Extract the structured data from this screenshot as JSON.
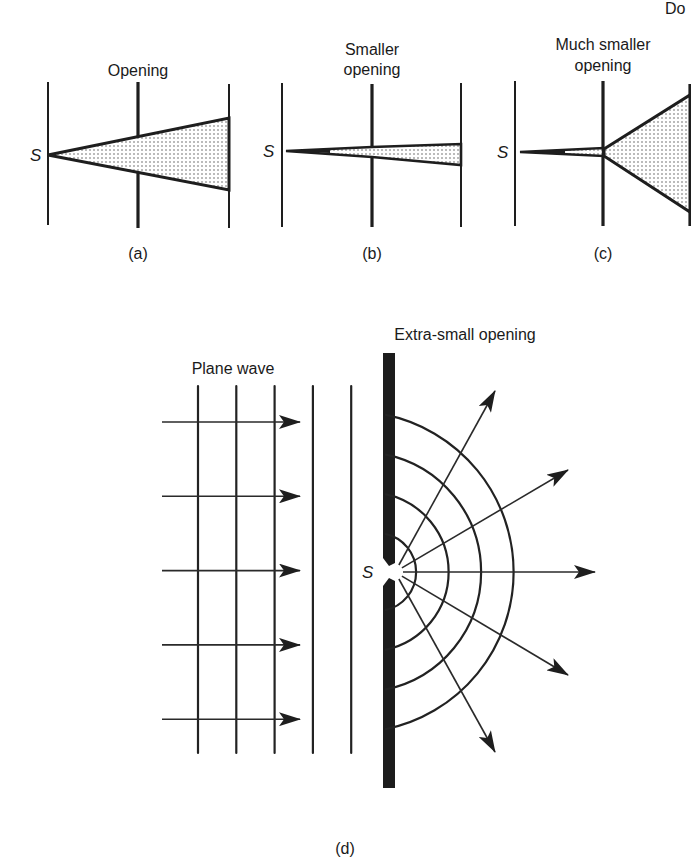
{
  "header": {
    "corner_text": "Do"
  },
  "panels": {
    "a": {
      "title": "Opening",
      "caption": "(a)",
      "source_label": "S"
    },
    "b": {
      "title_line1": "Smaller",
      "title_line2": "opening",
      "caption": "(b)",
      "source_label": "S"
    },
    "c": {
      "title_line1": "Much smaller",
      "title_line2": "opening",
      "caption": "(c)",
      "source_label": "S"
    },
    "d": {
      "plane_wave_label": "Plane wave",
      "opening_label": "Extra-small opening",
      "source_label": "S",
      "caption": "(d)",
      "plane_wavefront_count": 5,
      "incident_ray_count": 5,
      "circular_wavefront_count": 4,
      "diffracted_ray_count": 5
    }
  },
  "colors": {
    "ink": "#1e1e1e",
    "paper": "#ffffff",
    "stipple": "#555555"
  }
}
